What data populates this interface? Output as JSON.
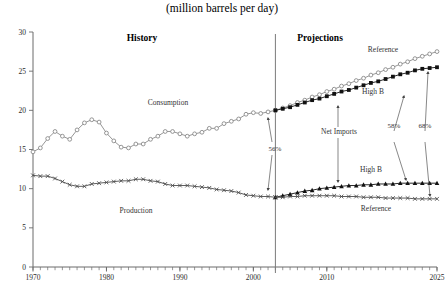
{
  "chart_title": "(million barrels per day)",
  "sections": {
    "history_label": "History",
    "projections_label": "Projections"
  },
  "axes": {
    "ylabel": "",
    "xlabel": "",
    "ylim": [
      0,
      30
    ],
    "xlim": [
      1970,
      2025
    ],
    "yticks": [
      "0",
      "5",
      "10",
      "15",
      "20",
      "25",
      "30"
    ],
    "ytick_values": [
      0,
      5,
      10,
      15,
      20,
      25,
      30
    ],
    "xticks": [
      "1970",
      "1980",
      "1990",
      "2000",
      "2010",
      "2025"
    ],
    "xtick_values": [
      1970,
      1980,
      1990,
      2000,
      2010,
      2025
    ],
    "grid": false,
    "minor_tick_step": 1
  },
  "divider": {
    "label": "history-projection-divider",
    "x_value": 2003
  },
  "annotations": {
    "consumption": "Consumption",
    "production": "Production",
    "net_imports": "Net Imports",
    "reference_top": "Reference",
    "high_b_top": "High B",
    "high_b_bottom": "High B",
    "reference_bottom": "Reference",
    "pct_2003": "56%",
    "pct_high_b_2025": "58%",
    "pct_reference_2025": "68%"
  },
  "colors": {
    "history_consumption": "#8a8a8a",
    "history_production": "#4a4a4a",
    "projection_reference": "#8a8a8a",
    "projection_high_b": "#111111",
    "axis": "#6b6b6b",
    "divider": "#7a7a7a",
    "text": "#2b2b2b"
  },
  "chart_data": {
    "type": "line",
    "title": "(million barrels per day)",
    "xlabel": "",
    "ylabel": "",
    "xlim": [
      1970,
      2025
    ],
    "ylim": [
      0,
      30
    ],
    "grid": false,
    "legend": "inline-annotations",
    "series": [
      {
        "name": "Consumption",
        "phase": "history",
        "marker": "open-circle",
        "color": "#8a8a8a",
        "x": [
          1970,
          1971,
          1972,
          1973,
          1974,
          1975,
          1976,
          1977,
          1978,
          1979,
          1980,
          1981,
          1982,
          1983,
          1984,
          1985,
          1986,
          1987,
          1988,
          1989,
          1990,
          1991,
          1992,
          1993,
          1994,
          1995,
          1996,
          1997,
          1998,
          1999,
          2000,
          2001,
          2002,
          2003
        ],
        "values": [
          14.7,
          15.2,
          16.4,
          17.3,
          16.7,
          16.3,
          17.5,
          18.4,
          18.8,
          18.5,
          17.1,
          16.1,
          15.3,
          15.2,
          15.7,
          15.7,
          16.3,
          16.7,
          17.3,
          17.3,
          17.0,
          16.7,
          17.0,
          17.2,
          17.7,
          17.7,
          18.3,
          18.6,
          18.9,
          19.5,
          19.7,
          19.6,
          19.8,
          20.0
        ]
      },
      {
        "name": "Production",
        "phase": "history",
        "marker": "x",
        "color": "#4a4a4a",
        "x": [
          1970,
          1971,
          1972,
          1973,
          1974,
          1975,
          1976,
          1977,
          1978,
          1979,
          1980,
          1981,
          1982,
          1983,
          1984,
          1985,
          1986,
          1987,
          1988,
          1989,
          1990,
          1991,
          1992,
          1993,
          1994,
          1995,
          1996,
          1997,
          1998,
          1999,
          2000,
          2001,
          2002,
          2003
        ],
        "values": [
          11.7,
          11.6,
          11.6,
          11.3,
          10.9,
          10.5,
          10.3,
          10.3,
          10.6,
          10.7,
          10.8,
          10.9,
          11.0,
          11.0,
          11.2,
          11.2,
          11.0,
          10.9,
          10.6,
          10.4,
          10.4,
          10.4,
          10.3,
          10.2,
          10.1,
          9.9,
          9.8,
          9.7,
          9.5,
          9.2,
          9.1,
          9.0,
          9.0,
          8.9
        ]
      },
      {
        "name": "Reference",
        "phase": "projection",
        "position": "top",
        "marker": "open-circle",
        "color": "#8a8a8a",
        "x": [
          2003,
          2004,
          2005,
          2006,
          2007,
          2008,
          2009,
          2010,
          2011,
          2012,
          2013,
          2014,
          2015,
          2016,
          2017,
          2018,
          2019,
          2020,
          2021,
          2022,
          2023,
          2024,
          2025
        ],
        "values": [
          20.0,
          20.3,
          20.6,
          21.0,
          21.3,
          21.7,
          22.0,
          22.4,
          22.7,
          23.1,
          23.4,
          23.8,
          24.1,
          24.5,
          24.8,
          25.2,
          25.5,
          25.9,
          26.2,
          26.6,
          26.9,
          27.2,
          27.5
        ]
      },
      {
        "name": "High B",
        "phase": "projection",
        "position": "top",
        "marker": "filled-square",
        "color": "#111111",
        "x": [
          2003,
          2004,
          2005,
          2006,
          2007,
          2008,
          2009,
          2010,
          2011,
          2012,
          2013,
          2014,
          2015,
          2016,
          2017,
          2018,
          2019,
          2020,
          2021,
          2022,
          2023,
          2024,
          2025
        ],
        "values": [
          20.0,
          20.2,
          20.4,
          20.7,
          21.0,
          21.3,
          21.5,
          21.8,
          22.1,
          22.4,
          22.6,
          22.9,
          23.2,
          23.5,
          23.7,
          24.0,
          24.3,
          24.6,
          24.8,
          25.1,
          25.3,
          25.4,
          25.5
        ]
      },
      {
        "name": "High B",
        "phase": "projection",
        "position": "bottom",
        "marker": "filled-triangle",
        "color": "#111111",
        "x": [
          2003,
          2004,
          2005,
          2006,
          2007,
          2008,
          2009,
          2010,
          2011,
          2012,
          2013,
          2014,
          2015,
          2016,
          2017,
          2018,
          2019,
          2020,
          2021,
          2022,
          2023,
          2024,
          2025
        ],
        "values": [
          8.9,
          9.1,
          9.3,
          9.5,
          9.7,
          9.8,
          10.0,
          10.1,
          10.2,
          10.3,
          10.4,
          10.4,
          10.5,
          10.5,
          10.6,
          10.6,
          10.6,
          10.7,
          10.7,
          10.7,
          10.7,
          10.7,
          10.7
        ]
      },
      {
        "name": "Reference",
        "phase": "projection",
        "position": "bottom",
        "marker": "x",
        "color": "#4a4a4a",
        "x": [
          2003,
          2004,
          2005,
          2006,
          2007,
          2008,
          2009,
          2010,
          2011,
          2012,
          2013,
          2014,
          2015,
          2016,
          2017,
          2018,
          2019,
          2020,
          2021,
          2022,
          2023,
          2024,
          2025
        ],
        "values": [
          8.9,
          8.9,
          9.0,
          9.0,
          9.1,
          9.1,
          9.1,
          9.1,
          9.1,
          9.0,
          9.0,
          9.0,
          8.9,
          8.9,
          8.9,
          8.8,
          8.8,
          8.8,
          8.8,
          8.7,
          8.7,
          8.7,
          8.7
        ]
      }
    ]
  }
}
